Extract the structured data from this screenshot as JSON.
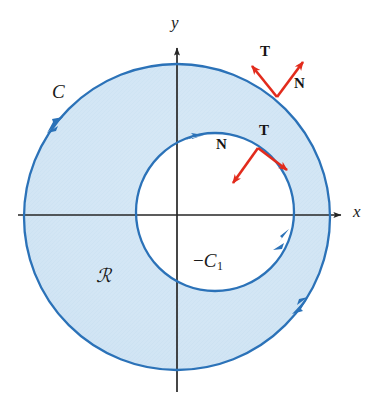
{
  "figure": {
    "background_color": "#ffffff"
  },
  "axes": {
    "x_label": "x",
    "y_label": "y",
    "axis_color": "#262626",
    "origin": {
      "x": 177,
      "y": 215
    },
    "x_axis": {
      "x_start": 18,
      "x_end": 347,
      "y": 215
    },
    "y_axis": {
      "y_start": 42,
      "y_end": 392,
      "x": 177
    }
  },
  "region": {
    "label": "ℛ",
    "label_position": {
      "x": 96,
      "y": 268
    },
    "fill_color": "#d3e6f5",
    "description": "shaded annulus between the two circles"
  },
  "curves": [
    {
      "name": "outer-boundary",
      "label": "C",
      "label_position": {
        "x": 52,
        "y": 82
      },
      "orientation": "counterclockwise",
      "stroke_color": "#2b72b8",
      "stroke_width": 2.2,
      "center": {
        "x": 177,
        "y": 217
      },
      "radius": 153
    },
    {
      "name": "inner-boundary",
      "label_prefix": "−",
      "label_base": "C",
      "label_subscript": "1",
      "label_position": {
        "x": 196,
        "y": 262
      },
      "orientation": "clockwise",
      "stroke_color": "#2b72b8",
      "stroke_width": 2.2,
      "center": {
        "x": 215,
        "y": 212
      },
      "radius": 79
    }
  ],
  "vectors": {
    "color": "#e22b1c",
    "outer": {
      "origin": {
        "x": 276,
        "y": 96
      },
      "tangent": {
        "label": "T",
        "label_position": {
          "x": 265,
          "y": 52
        },
        "tip": {
          "x": 249,
          "y": 63
        }
      },
      "normal": {
        "label": "N",
        "label_position": {
          "x": 297,
          "y": 83
        },
        "tip": {
          "x": 305,
          "y": 59
        }
      }
    },
    "inner": {
      "origin": {
        "x": 258,
        "y": 148
      },
      "tangent": {
        "label": "T",
        "label_position": {
          "x": 262,
          "y": 130
        },
        "tip": {
          "x": 290,
          "y": 173
        }
      },
      "normal": {
        "label": "N",
        "label_position": {
          "x": 219,
          "y": 144
        },
        "tip": {
          "x": 231,
          "y": 186
        }
      }
    }
  },
  "arrowheads": [
    {
      "name": "outer-upper-left-arrow",
      "position": {
        "x": 52,
        "y": 128
      },
      "direction": "down-left"
    },
    {
      "name": "outer-lower-right-arrow",
      "position": {
        "x": 305,
        "y": 300
      },
      "direction": "up-right"
    },
    {
      "name": "inner-top-arrow",
      "position": {
        "x": 200,
        "y": 137
      },
      "direction": "right"
    },
    {
      "name": "inner-lower-right-arrow",
      "position": {
        "x": 277,
        "y": 245
      },
      "direction": "down-left"
    }
  ],
  "colors": {
    "fill": "#d3e6f5",
    "curve": "#2b72b8",
    "vector": "#e22b1c",
    "axis": "#262626",
    "text": "#1a1a1a"
  }
}
